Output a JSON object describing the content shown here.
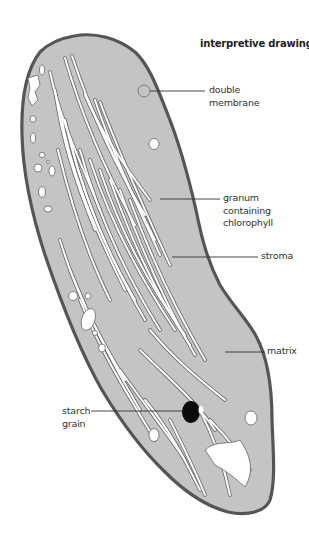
{
  "title": "interpretive drawing",
  "labels": {
    "double_membrane": [
      "double",
      "membrane"
    ],
    "granum": [
      "granum",
      "containing",
      "chlorophyll"
    ],
    "stroma": [
      "stroma"
    ],
    "matrix": [
      "matrix"
    ],
    "starch_grain": [
      "starch",
      "grain"
    ]
  },
  "colors": {
    "background": "#ffffff",
    "matrix_fill": "#c4c4c4",
    "membrane_outline": "#555555",
    "thylakoid_fill": "#ffffff",
    "thylakoid_outline": "#666666",
    "starch_grain": "#0a0a0a",
    "leader_line": "#333333",
    "text": "#333333"
  }
}
